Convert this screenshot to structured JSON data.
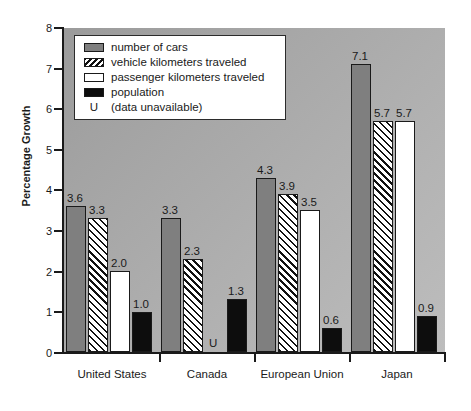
{
  "chart_data": {
    "type": "bar",
    "title": "",
    "xlabel": "",
    "ylabel": "Percentage Growth",
    "ylim": [
      0,
      8
    ],
    "ytick_labels": [
      "0",
      "1",
      "2",
      "3",
      "4",
      "5",
      "6",
      "7",
      "8"
    ],
    "grid": false,
    "legend_position": "upper-left-inside",
    "categories": [
      "United States",
      "Canada",
      "European Union",
      "Japan"
    ],
    "series": [
      {
        "name": "number of cars",
        "swatch": "solid-gray",
        "color": "#7f7f7f",
        "values": [
          3.6,
          3.3,
          4.3,
          7.1
        ],
        "labels": [
          "3.6",
          "3.3",
          "4.3",
          "7.1"
        ]
      },
      {
        "name": "vehicle kilometers traveled",
        "swatch": "diagonal-hatch",
        "color": "#ffffff",
        "values": [
          3.3,
          2.3,
          3.9,
          5.7
        ],
        "labels": [
          "3.3",
          "2.3",
          "3.9",
          "5.7"
        ]
      },
      {
        "name": "passenger kilometers traveled",
        "swatch": "white",
        "color": "#ffffff",
        "values": [
          2.0,
          null,
          3.5,
          5.7
        ],
        "labels": [
          "2.0",
          "U",
          "3.5",
          "5.7"
        ]
      },
      {
        "name": "population",
        "swatch": "solid-black",
        "color": "#0d0d0d",
        "values": [
          1.0,
          1.3,
          0.6,
          0.9
        ],
        "labels": [
          "1.0",
          "1.3",
          "0.6",
          "0.9"
        ]
      }
    ],
    "unavailable_marker": "U",
    "unavailable_note": "(data unavailable)"
  },
  "legend": {
    "rows": [
      {
        "label": "number of cars"
      },
      {
        "label": "vehicle kilometers traveled"
      },
      {
        "label": "passenger kilometers traveled"
      },
      {
        "label": "population"
      },
      {
        "marker": "U",
        "label": "(data unavailable)"
      }
    ]
  },
  "axis": {
    "y_title": "Percentage Growth",
    "y_ticks": [
      "8",
      "7",
      "6",
      "5",
      "4",
      "3",
      "2",
      "1",
      "0"
    ],
    "x_ticks": [
      "United States",
      "Canada",
      "European Union",
      "Japan"
    ]
  },
  "colors": {
    "cars": "#7f7f7f",
    "population": "#0d0d0d",
    "plot_background_top": "#9b9b9b",
    "plot_background_bottom": "#bdbdbd",
    "axis": "#1a1a1a"
  }
}
